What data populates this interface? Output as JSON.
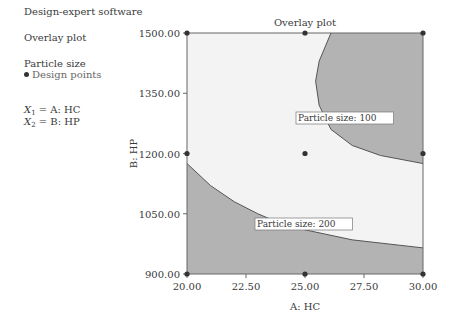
{
  "legend": {
    "software": "Design-expert software",
    "plot_type": "Overlay plot",
    "response": "Particle size",
    "design_points": "Design points",
    "x1": {
      "sym": "X",
      "sub": "1",
      "label": "= A: HC"
    },
    "x2": {
      "sym": "X",
      "sub": "2",
      "label": "= B: HP"
    }
  },
  "chart_data": {
    "type": "contour",
    "title": "Overlay plot",
    "xlabel": "A: HC",
    "ylabel": "B: HP",
    "xlim": [
      20.0,
      30.0
    ],
    "ylim": [
      900.0,
      1500.0
    ],
    "xticks": [
      "20.00",
      "22.50",
      "25.00",
      "27.50",
      "30.00"
    ],
    "yticks": [
      "900.00",
      "1050.00",
      "1200.00",
      "1350.00",
      "1500.00"
    ],
    "contours": [
      {
        "label": "Particle size: 100",
        "shaded_side": "upper-right",
        "points": [
          [
            26.1,
            1500
          ],
          [
            25.6,
            1430
          ],
          [
            25.45,
            1380
          ],
          [
            25.6,
            1320
          ],
          [
            26.1,
            1260
          ],
          [
            27.0,
            1220
          ],
          [
            28.2,
            1195
          ],
          [
            30.0,
            1175
          ]
        ]
      },
      {
        "label": "Particle size: 200",
        "shaded_side": "lower",
        "points": [
          [
            20.0,
            1175
          ],
          [
            21.0,
            1120
          ],
          [
            22.0,
            1080
          ],
          [
            23.0,
            1050
          ],
          [
            24.0,
            1025
          ],
          [
            25.0,
            1010
          ],
          [
            27.0,
            985
          ],
          [
            30.0,
            965
          ]
        ]
      }
    ],
    "design_points": [
      [
        20,
        900
      ],
      [
        25,
        900
      ],
      [
        30,
        900
      ],
      [
        20,
        1200
      ],
      [
        25,
        1200
      ],
      [
        30,
        1200
      ],
      [
        20,
        1500
      ],
      [
        25,
        1500
      ],
      [
        30,
        1500
      ]
    ],
    "colors": {
      "shaded": "#b3b3b3",
      "feasible": "#f3f3f3",
      "line": "#555555"
    }
  }
}
